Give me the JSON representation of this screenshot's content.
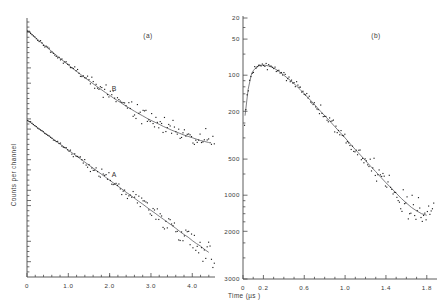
{
  "figure": {
    "background": "#ffffff",
    "ink": "#2b2b2b"
  },
  "panel_a": {
    "label": "(a)",
    "ylabel": "Counts per channel",
    "xlabel": "",
    "curve_labels": {
      "upper": "B",
      "lower": "A"
    },
    "xticks": [
      "0",
      "1.0",
      "2.0",
      "3.0",
      "4.0"
    ]
  },
  "panel_b": {
    "label": "(b)",
    "xlabel": "Time (µs )",
    "yticks": [
      "3000",
      "2000",
      "1000",
      "500",
      "200",
      "100",
      "50",
      "20"
    ],
    "xticks": [
      "0",
      "0.2",
      "0.6",
      "1.0",
      "1.4",
      "1.8"
    ]
  },
  "chart_data": [
    {
      "type": "scatter",
      "id": "panel-a",
      "title": "(a)",
      "xlabel": "Time (µs )",
      "ylabel": "Counts per channel",
      "xlim": [
        0,
        4.55
      ],
      "ylim_note": "logarithmic counts axis, unlabelled ticks only",
      "yscale": "log",
      "xticks": [
        0,
        1.0,
        2.0,
        3.0,
        4.0
      ],
      "grid": false,
      "legend": "inline curve labels A and B",
      "series": [
        {
          "name": "B",
          "label_x": 2.05,
          "description": "upper decay curve, non-exponential, flattens after 3 µs",
          "x": [
            0.0,
            0.1,
            0.2,
            0.3,
            0.4,
            0.5,
            0.6,
            0.7,
            0.8,
            0.9,
            1.0,
            1.1,
            1.2,
            1.3,
            1.4,
            1.5,
            1.6,
            1.7,
            1.8,
            1.9,
            2.0,
            2.1,
            2.2,
            2.3,
            2.4,
            2.5,
            2.6,
            2.7,
            2.8,
            2.9,
            3.0,
            3.1,
            3.2,
            3.3,
            3.4,
            3.5,
            3.6,
            3.7,
            3.8,
            3.9,
            4.0,
            4.1,
            4.2,
            4.3,
            4.4
          ],
          "y_rel": [
            1.0,
            0.925,
            0.857,
            0.795,
            0.738,
            0.686,
            0.638,
            0.594,
            0.553,
            0.516,
            0.482,
            0.45,
            0.421,
            0.394,
            0.369,
            0.346,
            0.325,
            0.305,
            0.287,
            0.27,
            0.255,
            0.24,
            0.227,
            0.215,
            0.203,
            0.193,
            0.183,
            0.174,
            0.166,
            0.158,
            0.151,
            0.145,
            0.139,
            0.133,
            0.128,
            0.123,
            0.119,
            0.115,
            0.111,
            0.108,
            0.105,
            0.102,
            0.099,
            0.097,
            0.095
          ]
        },
        {
          "name": "A",
          "label_x": 2.05,
          "description": "lower decay curve, near straight line on log axis (single exponential)",
          "x": [
            0.0,
            0.1,
            0.2,
            0.3,
            0.4,
            0.5,
            0.6,
            0.7,
            0.8,
            0.9,
            1.0,
            1.1,
            1.2,
            1.3,
            1.4,
            1.5,
            1.6,
            1.7,
            1.8,
            1.9,
            2.0,
            2.1,
            2.2,
            2.3,
            2.4,
            2.5,
            2.6,
            2.7,
            2.8,
            2.9,
            3.0,
            3.1,
            3.2,
            3.3,
            3.4,
            3.5,
            3.6,
            3.7,
            3.8,
            3.9,
            4.0,
            4.1,
            4.2,
            4.3,
            4.4
          ],
          "y_rel": [
            1.0,
            0.94,
            0.883,
            0.83,
            0.78,
            0.733,
            0.689,
            0.647,
            0.608,
            0.572,
            0.537,
            0.505,
            0.474,
            0.446,
            0.419,
            0.394,
            0.37,
            0.348,
            0.327,
            0.307,
            0.289,
            0.271,
            0.255,
            0.24,
            0.225,
            0.212,
            0.199,
            0.187,
            0.176,
            0.165,
            0.155,
            0.146,
            0.137,
            0.129,
            0.121,
            0.114,
            0.107,
            0.1,
            0.094,
            0.089,
            0.083,
            0.078,
            0.074,
            0.069,
            0.065
          ]
        }
      ]
    },
    {
      "type": "scatter",
      "id": "panel-b",
      "title": "(b)",
      "xlabel": "Time (µs )",
      "ylabel": "Counts per channel",
      "yscale": "log",
      "ylim": [
        20,
        3000
      ],
      "xlim": [
        0,
        1.9
      ],
      "yticks": [
        20,
        50,
        100,
        200,
        500,
        1000,
        2000,
        3000
      ],
      "xticks": [
        0,
        0.2,
        0.6,
        1.0,
        1.4,
        1.8
      ],
      "grid": false,
      "series": [
        {
          "name": "rise-and-decay",
          "description": "fast rise to peak near 0.2 µs at ~1200 counts then decay to ~85 counts at 1.85 µs",
          "x": [
            0.02,
            0.05,
            0.08,
            0.1,
            0.12,
            0.14,
            0.16,
            0.18,
            0.2,
            0.22,
            0.25,
            0.28,
            0.31,
            0.34,
            0.37,
            0.4,
            0.44,
            0.48,
            0.52,
            0.56,
            0.6,
            0.64,
            0.68,
            0.72,
            0.76,
            0.8,
            0.85,
            0.9,
            0.95,
            1.0,
            1.05,
            1.1,
            1.15,
            1.2,
            1.25,
            1.3,
            1.35,
            1.4,
            1.45,
            1.5,
            1.55,
            1.6,
            1.65,
            1.7,
            1.75,
            1.8,
            1.85
          ],
          "y": [
            460,
            760,
            1000,
            1090,
            1140,
            1175,
            1200,
            1210,
            1215,
            1210,
            1195,
            1170,
            1135,
            1095,
            1050,
            1000,
            940,
            880,
            820,
            760,
            700,
            645,
            595,
            545,
            500,
            460,
            415,
            372,
            334,
            300,
            268,
            240,
            216,
            194,
            174,
            157,
            141,
            127,
            115,
            104,
            94,
            86,
            79,
            74,
            70,
            68,
            85
          ]
        }
      ]
    }
  ]
}
